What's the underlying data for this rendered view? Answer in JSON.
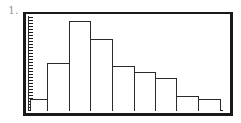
{
  "problem_label": "1.",
  "chart_data": {
    "type": "bar",
    "subtype": "histogram",
    "title": "",
    "xlabel": "",
    "ylabel": "",
    "categories": [
      "1",
      "2",
      "3",
      "4",
      "5",
      "6",
      "7",
      "8",
      "9"
    ],
    "values": [
      4,
      16,
      30,
      24,
      15,
      13,
      11,
      5,
      4
    ],
    "ylim": [
      0,
      31
    ],
    "y_tick_step": 1,
    "grid": false,
    "legend": null,
    "bar_edges_px": [
      30,
      47,
      69,
      90,
      112,
      134,
      155,
      176,
      198,
      220
    ],
    "px_per_unit": 3
  },
  "colors": {
    "frame": "#1a1a1a",
    "bar_outline": "#2a2a2a",
    "bar_fill": "#ffffff",
    "label": "#9a9a9a"
  }
}
